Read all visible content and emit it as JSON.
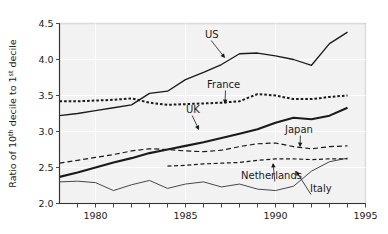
{
  "chart_data": {
    "type": "line",
    "title": "",
    "xlabel": "",
    "ylabel": "Ratio of 10th decile to 1st decile",
    "ylabel_parts": [
      {
        "text": "Ratio of 10",
        "sup": false
      },
      {
        "text": "th",
        "sup": true
      },
      {
        "text": " decile to 1",
        "sup": false
      },
      {
        "text": "st",
        "sup": true
      },
      {
        "text": " decile",
        "sup": false
      }
    ],
    "xlim": [
      1978,
      1995
    ],
    "ylim": [
      2.0,
      4.5
    ],
    "yticks": [
      2.0,
      2.5,
      3.0,
      3.5,
      4.0,
      4.5
    ],
    "ytick_labels": [
      "2.0",
      "2.5",
      "3.0",
      "3.5",
      "4.0",
      "4.5"
    ],
    "xticks": [
      1979,
      1980,
      1981,
      1982,
      1983,
      1984,
      1985,
      1986,
      1987,
      1988,
      1989,
      1990,
      1991,
      1992,
      1993,
      1994,
      1995
    ],
    "xtick_labels_shown": [
      "1980",
      "1985",
      "1990",
      "1995"
    ],
    "xtick_label_years": [
      1980,
      1985,
      1990,
      1995
    ],
    "grid": true,
    "grid_color": "#ffffff",
    "plot_bg": "#f2f2f2",
    "legend_position": "inline-annotations",
    "series": [
      {
        "name": "US",
        "style": "solid",
        "width": 1.3,
        "color": "#1a1a1a",
        "x": [
          1978,
          1979,
          1980,
          1981,
          1982,
          1983,
          1984,
          1985,
          1986,
          1987,
          1988,
          1989,
          1990,
          1991,
          1992,
          1993,
          1994
        ],
        "values": [
          3.22,
          3.25,
          3.29,
          3.33,
          3.37,
          3.53,
          3.56,
          3.72,
          3.82,
          3.93,
          4.08,
          4.09,
          4.05,
          4.0,
          3.92,
          4.22,
          4.38
        ]
      },
      {
        "name": "France",
        "style": "dotted-heavy",
        "width": 2.0,
        "color": "#1a1a1a",
        "x": [
          1978,
          1979,
          1980,
          1981,
          1982,
          1983,
          1984,
          1985,
          1986,
          1987,
          1988,
          1989,
          1990,
          1991,
          1992,
          1993,
          1994
        ],
        "values": [
          3.42,
          3.42,
          3.43,
          3.44,
          3.46,
          3.4,
          3.37,
          3.38,
          3.39,
          3.4,
          3.42,
          3.52,
          3.5,
          3.45,
          3.45,
          3.48,
          3.5
        ]
      },
      {
        "name": "UK",
        "style": "solid",
        "width": 2.1,
        "color": "#1a1a1a",
        "x": [
          1978,
          1979,
          1980,
          1981,
          1982,
          1983,
          1984,
          1985,
          1986,
          1987,
          1988,
          1989,
          1990,
          1991,
          1992,
          1993,
          1994
        ],
        "values": [
          2.37,
          2.43,
          2.5,
          2.57,
          2.63,
          2.7,
          2.75,
          2.8,
          2.85,
          2.91,
          2.97,
          3.03,
          3.12,
          3.19,
          3.17,
          3.22,
          3.33
        ]
      },
      {
        "name": "Japan",
        "style": "dashed-long",
        "width": 1.2,
        "color": "#1a1a1a",
        "x": [
          1978,
          1979,
          1980,
          1981,
          1982,
          1983,
          1984,
          1985,
          1986,
          1987,
          1988,
          1989,
          1990,
          1991,
          1992,
          1993,
          1994
        ],
        "values": [
          2.56,
          2.6,
          2.64,
          2.68,
          2.73,
          2.76,
          2.75,
          2.73,
          2.72,
          2.74,
          2.79,
          2.83,
          2.84,
          2.79,
          2.76,
          2.79,
          2.8
        ]
      },
      {
        "name": "Netherlands",
        "style": "dashed-medium",
        "width": 1.2,
        "color": "#1a1a1a",
        "x": [
          1984,
          1985,
          1986,
          1987,
          1988,
          1989,
          1990,
          1991,
          1992,
          1993,
          1994
        ],
        "values": [
          2.52,
          2.53,
          2.55,
          2.56,
          2.57,
          2.6,
          2.62,
          2.62,
          2.61,
          2.62,
          2.62
        ]
      },
      {
        "name": "Italy",
        "style": "solid",
        "width": 0.8,
        "color": "#1a1a1a",
        "x": [
          1978,
          1979,
          1980,
          1981,
          1982,
          1983,
          1984,
          1985,
          1986,
          1987,
          1988,
          1989,
          1990,
          1991,
          1992,
          1993,
          1994
        ],
        "values": [
          2.3,
          2.31,
          2.29,
          2.18,
          2.26,
          2.32,
          2.21,
          2.27,
          2.3,
          2.23,
          2.27,
          2.2,
          2.18,
          2.24,
          2.45,
          2.58,
          2.63
        ]
      }
    ],
    "annotations": [
      {
        "label": "US",
        "tx": 205,
        "ty": 38,
        "px": 225,
        "py": 58
      },
      {
        "label": "France",
        "tx": 207,
        "ty": 88,
        "px": 225,
        "py": 104
      },
      {
        "label": "UK",
        "tx": 186,
        "ty": 113,
        "px": 199,
        "py": 130
      },
      {
        "label": "Japan",
        "tx": 285,
        "ty": 133,
        "px": 300,
        "py": 147
      },
      {
        "label": "Netherlands",
        "tx": 241,
        "ty": 179,
        "px": 273,
        "py": 163
      },
      {
        "label": "Italy",
        "tx": 310,
        "ty": 192,
        "px": 296,
        "py": 171
      }
    ]
  }
}
